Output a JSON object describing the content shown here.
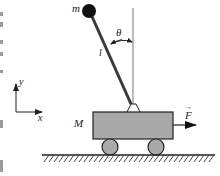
{
  "diagram": {
    "labels": {
      "pendulum_mass": "m",
      "angle": "θ",
      "length": "l",
      "cart_mass": "M",
      "force": "F",
      "force_vector_mark": "→",
      "axis_y": "y",
      "axis_x": "x"
    },
    "colors": {
      "cart_fill": "#a9a9a9",
      "stroke": "#222222",
      "rod": "#3a3a3a",
      "bob": "#111111",
      "reference_line": "#aaaaaa",
      "ground_hatch": "#333333"
    }
  }
}
